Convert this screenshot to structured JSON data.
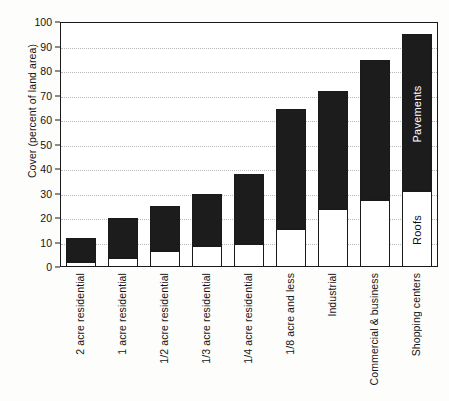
{
  "chart_data": {
    "type": "bar",
    "stacked": true,
    "title": "",
    "xlabel": "",
    "ylabel": "Cover (percent of land area)",
    "ylim": [
      0,
      100
    ],
    "ytick_step": 10,
    "yticks": [
      "0",
      "10",
      "20",
      "30",
      "40",
      "50",
      "60",
      "70",
      "80",
      "90",
      "100"
    ],
    "grid": true,
    "grid_style": "dotted-horizontal",
    "legend_position": "in-bar (Shopping centers)",
    "categories": [
      "2 acre residential",
      "1 acre residential",
      "1/2 acre residential",
      "1/3 acre residential",
      "1/4 acre residential",
      "1/8 acre and less",
      "Industrial",
      "Commercial & business",
      "Shopping centers"
    ],
    "series": [
      {
        "name": "Roofs",
        "color": "#ffffff",
        "values": [
          2,
          3.5,
          6.5,
          8.5,
          9.5,
          15.5,
          23.5,
          27.5,
          31
        ]
      },
      {
        "name": "Pavements",
        "color": "#1c1c1c",
        "values": [
          10,
          16.5,
          18.5,
          21.5,
          28.5,
          49,
          48.5,
          57,
          64
        ]
      }
    ],
    "totals": [
      12,
      20,
      25,
      30,
      38,
      64.5,
      72,
      84.5,
      95
    ],
    "annotations": [
      {
        "text": "Pavements",
        "on_category": "Shopping centers",
        "on_series": "Pavements"
      },
      {
        "text": "Roofs",
        "on_category": "Shopping centers",
        "on_series": "Roofs"
      }
    ]
  }
}
